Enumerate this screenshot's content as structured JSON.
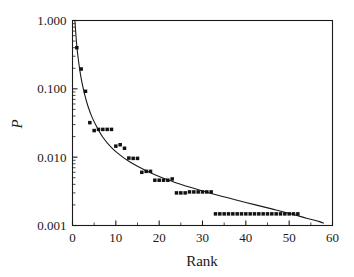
{
  "chart_data": {
    "type": "scatter",
    "title": "",
    "xlabel": "Rank",
    "ylabel": "P",
    "xlim": [
      0,
      60
    ],
    "ylim": [
      0.001,
      1.0
    ],
    "yscale": "log",
    "xscale": "linear",
    "grid": false,
    "legend": null,
    "xticks": [
      0,
      10,
      20,
      30,
      40,
      50,
      60
    ],
    "xtick_labels": [
      "0",
      "10",
      "20",
      "30",
      "40",
      "50",
      "60"
    ],
    "yticks": [
      0.001,
      0.01,
      0.1,
      1.0
    ],
    "ytick_labels": [
      "0.001",
      "0.010",
      "0.100",
      "1.000"
    ],
    "marker": "filled-square",
    "marker_color": "#111111",
    "line_color": "#1a1a1a",
    "series": [
      {
        "name": "observed",
        "kind": "scatter",
        "x": [
          1,
          2,
          3,
          4,
          5,
          6,
          7,
          8,
          9,
          10,
          11,
          12,
          13,
          14,
          15,
          16,
          17,
          18,
          19,
          20,
          21,
          22,
          23,
          24,
          25,
          26,
          27,
          28,
          29,
          30,
          31,
          32,
          33,
          34,
          35,
          36,
          37,
          38,
          39,
          40,
          41,
          42,
          43,
          44,
          45,
          46,
          47,
          48,
          49,
          50,
          51,
          52
        ],
        "y": [
          0.4,
          0.195,
          0.092,
          0.032,
          0.0245,
          0.0255,
          0.0255,
          0.0255,
          0.0255,
          0.0145,
          0.0152,
          0.0135,
          0.0097,
          0.0096,
          0.0096,
          0.006,
          0.0062,
          0.0062,
          0.0046,
          0.0046,
          0.0046,
          0.0046,
          0.0048,
          0.003,
          0.003,
          0.003,
          0.0031,
          0.0031,
          0.0031,
          0.0031,
          0.0031,
          0.0031,
          0.00148,
          0.00148,
          0.00148,
          0.00148,
          0.00148,
          0.00148,
          0.00148,
          0.00148,
          0.00148,
          0.00148,
          0.00148,
          0.00148,
          0.00148,
          0.00148,
          0.00148,
          0.00148,
          0.00148,
          0.00148,
          0.00148,
          0.00148
        ]
      },
      {
        "name": "power-law fit",
        "kind": "line",
        "x": [
          0.55,
          0.8,
          1.0,
          1.3,
          1.7,
          2.2,
          2.8,
          3.5,
          4.5,
          5.5,
          7,
          9,
          11,
          13,
          15,
          18,
          21,
          24,
          27,
          30,
          34,
          38,
          42,
          46,
          50,
          54,
          57,
          58
        ],
        "y": [
          1.0,
          0.6,
          0.42,
          0.285,
          0.185,
          0.122,
          0.083,
          0.0575,
          0.0385,
          0.0285,
          0.0196,
          0.0138,
          0.0107,
          0.0087,
          0.00735,
          0.0059,
          0.0049,
          0.0042,
          0.00365,
          0.0032,
          0.00272,
          0.00234,
          0.00202,
          0.00175,
          0.00151,
          0.00128,
          0.00114,
          0.00108
        ]
      }
    ]
  },
  "axes": {
    "x_title": "Rank",
    "y_title": "P"
  }
}
